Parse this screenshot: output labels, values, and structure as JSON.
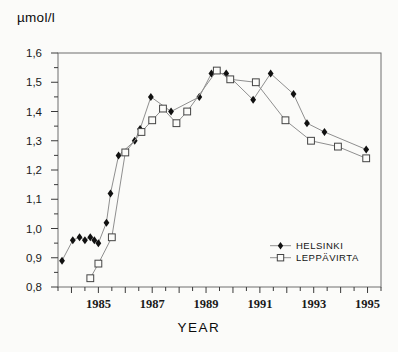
{
  "title": {
    "y_axis_unit": "µmol/l",
    "x_axis_title": "YEAR"
  },
  "legend": {
    "position": "inside-right-lower",
    "entries": [
      {
        "label": "HELSINKI",
        "marker": "filled-diamond-icon",
        "marker_color": "#111111",
        "line_color": "#8f8f8f"
      },
      {
        "label": "LEPPÄVIRTA",
        "marker": "open-square-icon",
        "marker_color": "#444444",
        "line_color": "#8f8f8f"
      }
    ]
  },
  "axes": {
    "y": {
      "min": 0.8,
      "max": 1.6,
      "major_step": 0.1,
      "minor_step": 0.05,
      "tick_labels": [
        "1,6",
        "1,5",
        "1,4",
        "1,3",
        "1,2",
        "1,1",
        "1,0",
        "0,9",
        "0,8"
      ]
    },
    "x": {
      "min": 1983.5,
      "max": 1995.5,
      "minor_step": 0.5,
      "label_years": [
        "1985",
        "1987",
        "1989",
        "1991",
        "1993",
        "1995"
      ]
    }
  },
  "chart_data": {
    "type": "line",
    "title": "",
    "xlabel": "YEAR",
    "ylabel": "µmol/l",
    "xlim": [
      1983.5,
      1995.5
    ],
    "ylim": [
      0.8,
      1.6
    ],
    "grid": false,
    "legend_position": "inside right, below middle",
    "series": [
      {
        "name": "HELSINKI",
        "marker": "filled-diamond",
        "points": [
          [
            1983.65,
            0.89
          ],
          [
            1984.05,
            0.96
          ],
          [
            1984.3,
            0.97
          ],
          [
            1984.5,
            0.96
          ],
          [
            1984.7,
            0.97
          ],
          [
            1984.85,
            0.96
          ],
          [
            1985.0,
            0.95
          ],
          [
            1985.3,
            1.02
          ],
          [
            1985.45,
            1.12
          ],
          [
            1985.75,
            1.25
          ],
          [
            1986.35,
            1.3
          ],
          [
            1986.55,
            1.34
          ],
          [
            1986.95,
            1.45
          ],
          [
            1987.7,
            1.4
          ],
          [
            1988.75,
            1.45
          ],
          [
            1989.2,
            1.53
          ],
          [
            1989.75,
            1.53
          ],
          [
            1990.75,
            1.44
          ],
          [
            1991.4,
            1.53
          ],
          [
            1992.25,
            1.46
          ],
          [
            1992.75,
            1.36
          ],
          [
            1993.4,
            1.33
          ],
          [
            1994.95,
            1.27
          ]
        ]
      },
      {
        "name": "LEPPÄVIRTA",
        "marker": "open-square",
        "points": [
          [
            1984.7,
            0.83
          ],
          [
            1985.0,
            0.88
          ],
          [
            1985.5,
            0.97
          ],
          [
            1986.0,
            1.26
          ],
          [
            1986.6,
            1.33
          ],
          [
            1987.0,
            1.37
          ],
          [
            1987.4,
            1.41
          ],
          [
            1987.9,
            1.36
          ],
          [
            1988.3,
            1.4
          ],
          [
            1989.4,
            1.54
          ],
          [
            1989.9,
            1.51
          ],
          [
            1990.85,
            1.5
          ],
          [
            1991.95,
            1.37
          ],
          [
            1992.9,
            1.3
          ],
          [
            1993.9,
            1.28
          ],
          [
            1994.95,
            1.24
          ]
        ]
      }
    ]
  },
  "colors": {
    "background": "#fbfbf9",
    "axis_box": "#6e6e6e",
    "tick": "#3a3a3a",
    "tick_text": "#1a1a1a",
    "series_line": "#8f8f8f",
    "diamond_fill": "#111111",
    "square_stroke": "#444444",
    "square_fill": "#fbfbf9"
  },
  "plot_box_px": {
    "left": 58,
    "top": 53,
    "right": 381,
    "bottom": 287
  }
}
